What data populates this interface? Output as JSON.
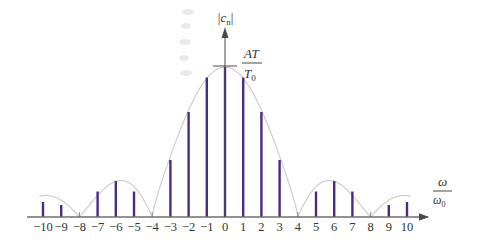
{
  "chart_data": {
    "type": "stem",
    "title": "",
    "xlabel": "ω/ω0",
    "ylabel": "|cn|",
    "peak_annotation": "AT/T0",
    "x": [
      -10,
      -9,
      -8,
      -7,
      -6,
      -5,
      -4,
      -3,
      -2,
      -1,
      0,
      1,
      2,
      3,
      4,
      5,
      6,
      7,
      8,
      9,
      10
    ],
    "tick_labels": [
      "−10",
      "−9",
      "−8",
      "−7",
      "−6",
      "−5",
      "−4",
      "−3",
      "−2",
      "−1",
      "0",
      "1",
      "2",
      "3",
      "4",
      "5",
      "6",
      "7",
      "8",
      "9",
      "10"
    ],
    "series": [
      {
        "name": "|cn| (normalized to AT/T0)",
        "values": [
          0.1,
          0.08,
          0.0,
          0.17,
          0.24,
          0.17,
          0.0,
          0.38,
          0.7,
          0.93,
          1.0,
          0.93,
          0.7,
          0.38,
          0.0,
          0.17,
          0.24,
          0.17,
          0.0,
          0.08,
          0.1
        ]
      }
    ],
    "envelope": "|sinc| magnitude envelope with zeros at ±4, ±8",
    "xlim": [
      -10.5,
      11.5
    ],
    "ylim": [
      0,
      1.0
    ],
    "grid": false,
    "legend": "none",
    "colors": {
      "stem": "#4b2a82",
      "envelope": "#c9c9c9",
      "axis": "#6f6f6f"
    }
  }
}
